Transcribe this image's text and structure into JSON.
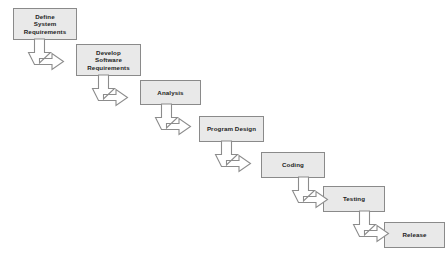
{
  "diagram": {
    "type": "waterfall-model-flowchart",
    "background_color": "#ffffff",
    "box_fill_color": "#e9e9e9",
    "box_border_color": "#8a8a8a",
    "text_color": "#1d1d1d",
    "arrow_fill_color": "#ffffff",
    "arrow_stroke_color": "#8c8c8c",
    "stages": [
      {
        "id": "define-system-requirements",
        "label": "Define\nSystem\nRequirements",
        "order": 1,
        "x": 13,
        "y": 8,
        "width": 64,
        "height": 32
      },
      {
        "id": "develop-software-requirements",
        "label": "Develop\nSoftware\nRequirements",
        "order": 2,
        "x": 76,
        "y": 44,
        "width": 65,
        "height": 32
      },
      {
        "id": "analysis",
        "label": "Analysis",
        "order": 3,
        "x": 140,
        "y": 80,
        "width": 61,
        "height": 25
      },
      {
        "id": "program-design",
        "label": "Program Design",
        "order": 4,
        "x": 199,
        "y": 116,
        "width": 65,
        "height": 26
      },
      {
        "id": "coding",
        "label": "Coding",
        "order": 5,
        "x": 261,
        "y": 152,
        "width": 64,
        "height": 26
      },
      {
        "id": "testing",
        "label": "Testing",
        "order": 6,
        "x": 323,
        "y": 186,
        "width": 62,
        "height": 26
      },
      {
        "id": "release",
        "label": "Release",
        "order": 7,
        "x": 384,
        "y": 222,
        "width": 61,
        "height": 26
      }
    ],
    "connectors": [
      {
        "id": "connector-1",
        "from": "define-system-requirements",
        "to": "develop-software-requirements",
        "shape": "elbow-down-right-double-arrow",
        "x": 25,
        "y": 39,
        "width": 54,
        "height": 29
      },
      {
        "id": "connector-2",
        "from": "develop-software-requirements",
        "to": "analysis",
        "shape": "elbow-down-right-double-arrow",
        "x": 89,
        "y": 75,
        "width": 54,
        "height": 29
      },
      {
        "id": "connector-3",
        "from": "analysis",
        "to": "program-design",
        "shape": "elbow-down-right-double-arrow",
        "x": 152,
        "y": 104,
        "width": 54,
        "height": 29
      },
      {
        "id": "connector-4",
        "from": "program-design",
        "to": "coding",
        "shape": "elbow-down-right-double-arrow",
        "x": 212,
        "y": 141,
        "width": 54,
        "height": 29
      },
      {
        "id": "connector-5",
        "from": "coding",
        "to": "testing",
        "shape": "elbow-down-right-double-arrow",
        "x": 289,
        "y": 177,
        "width": 40,
        "height": 29
      },
      {
        "id": "connector-6",
        "from": "testing",
        "to": "release",
        "shape": "elbow-down-right-double-arrow",
        "x": 350,
        "y": 211,
        "width": 40,
        "height": 29
      }
    ]
  }
}
